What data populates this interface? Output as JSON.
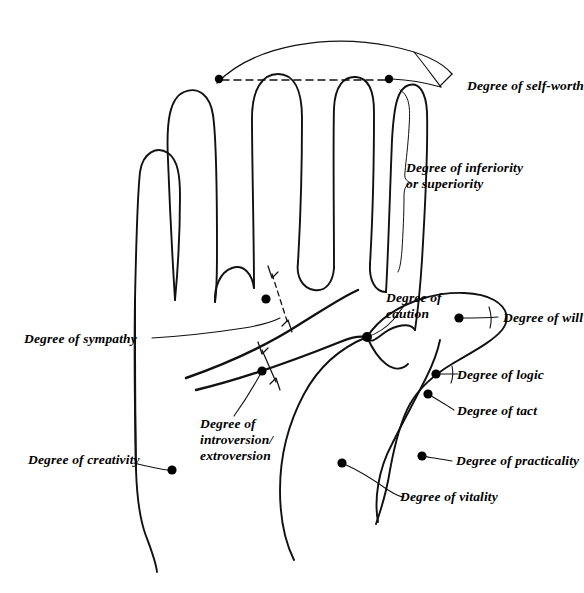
{
  "figure": {
    "background_color": "#ffffff",
    "ink_color": "#111111"
  },
  "labels": {
    "self_worth": "Degree of self-worth",
    "inferiority": "Degree of inferiority\nor superiority",
    "caution": "Degree of\ncaution",
    "will": "Degree of will",
    "logic": "Degree of logic",
    "tact": "Degree of tact",
    "practicality": "Degree of practicality",
    "vitality": "Degree of vitality",
    "sympathy": "Degree of sympathy",
    "creativity": "Degree of creativity",
    "introversion": "Degree of\nintroversion/\nextroversion"
  }
}
